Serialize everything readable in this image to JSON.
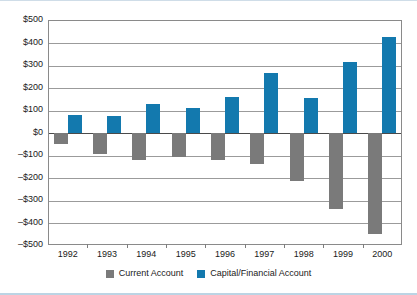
{
  "chart_data": {
    "type": "bar",
    "title": "",
    "subtitle": "",
    "xlabel": "",
    "ylabel": "",
    "categories": [
      "1992",
      "1993",
      "1994",
      "1995",
      "1996",
      "1997",
      "1998",
      "1999",
      "2000"
    ],
    "series": [
      {
        "name": "Current Account",
        "color": "#7a7a7a",
        "values": [
          -50,
          -95,
          -120,
          -110,
          -120,
          -140,
          -215,
          -340,
          -450
        ]
      },
      {
        "name": "Capital/Financial Account",
        "color": "#1379ae",
        "values": [
          80,
          75,
          125,
          110,
          160,
          265,
          155,
          315,
          425
        ]
      }
    ],
    "ylim": [
      -500,
      500
    ],
    "ytick_values": [
      500,
      400,
      300,
      200,
      100,
      0,
      -100,
      -200,
      -300,
      -400,
      -500
    ],
    "ytick_labels": [
      "$500",
      "$400",
      "$300",
      "$200",
      "$100",
      "$0",
      "–$100",
      "–$200",
      "–$300",
      "–$400",
      "–$500"
    ],
    "grid": true,
    "legend_position": "bottom",
    "zero_line": 0
  },
  "legend": {
    "items": [
      {
        "label": "Current Account",
        "swatch": "current"
      },
      {
        "label": "Capital/Financial Account",
        "swatch": "capital"
      }
    ]
  },
  "colors": {
    "current_account": "#7a7a7a",
    "capital_financial_account": "#1379ae",
    "gridline": "#9b9b9b",
    "axis": "#8a8a8a",
    "text": "#1a1a1a",
    "frame_accent": "#bcd4e4"
  }
}
